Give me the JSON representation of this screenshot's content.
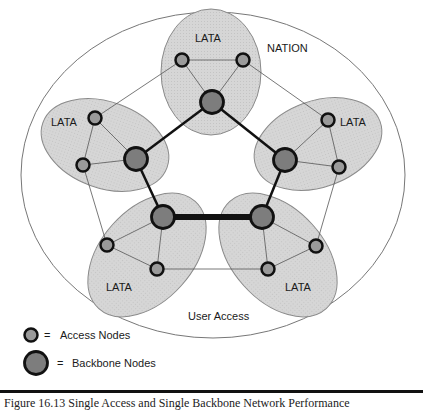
{
  "diagram": {
    "region_label": "NATION",
    "user_access_label": "User Access",
    "colors": {
      "lata_fill": "#d4d4d4",
      "lata_stroke": "#8a8a8a",
      "access_fill": "#9a9a9a",
      "backbone_fill": "#7d7d7d",
      "node_stroke": "#111111",
      "line": "#555555",
      "backbone_link": "#111111"
    },
    "latas": [
      {
        "label": "LATA",
        "position": "top"
      },
      {
        "label": "LATA",
        "position": "left"
      },
      {
        "label": "LATA",
        "position": "right"
      },
      {
        "label": "LATA",
        "position": "bottom-left"
      },
      {
        "label": "LATA",
        "position": "bottom-right"
      }
    ]
  },
  "legend": {
    "access": {
      "symbol": "=",
      "label": "Access Nodes"
    },
    "backbone": {
      "symbol": "=",
      "label": "Backbone Nodes"
    }
  },
  "caption": {
    "text": "Figure 16.13 Single Access and Single Backbone Network Performance"
  }
}
